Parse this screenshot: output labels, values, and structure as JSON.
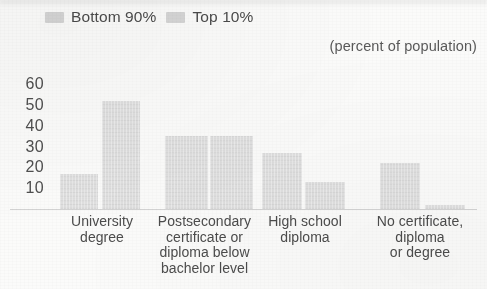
{
  "legend": {
    "position": "top-left",
    "entries": [
      {
        "label": "Bottom 90%",
        "swatch_name": "legend-swatch-bottom-90",
        "color": "#d2d2d2"
      },
      {
        "label": "Top 10%",
        "swatch_name": "legend-swatch-top-10",
        "color": "#d2d2d2"
      }
    ]
  },
  "subtitle": "(percent of population)",
  "chart_data": {
    "type": "bar",
    "title": "",
    "subtitle": "(percent of population)",
    "xlabel": "",
    "ylabel": "",
    "ylim": [
      0,
      65
    ],
    "yticks": [
      10,
      20,
      30,
      40,
      50,
      60
    ],
    "grid": false,
    "legend_position": "top-left",
    "categories": [
      "University degree",
      "Postsecondary certificate or diploma below bachelor level",
      "High school diploma",
      "No certificate, diploma or degree"
    ],
    "category_lines": [
      [
        "University",
        "degree"
      ],
      [
        "Postsecondary",
        "certificate or",
        "diploma below",
        "bachelor level"
      ],
      [
        "High school",
        "diploma"
      ],
      [
        "No certificate,",
        "diploma",
        "or degree"
      ]
    ],
    "series": [
      {
        "name": "Bottom 90%",
        "color": "#dedede",
        "values": [
          17,
          35,
          27,
          22
        ]
      },
      {
        "name": "Top 10%",
        "color": "#dedede",
        "values": [
          52,
          35,
          13,
          2
        ]
      }
    ]
  }
}
